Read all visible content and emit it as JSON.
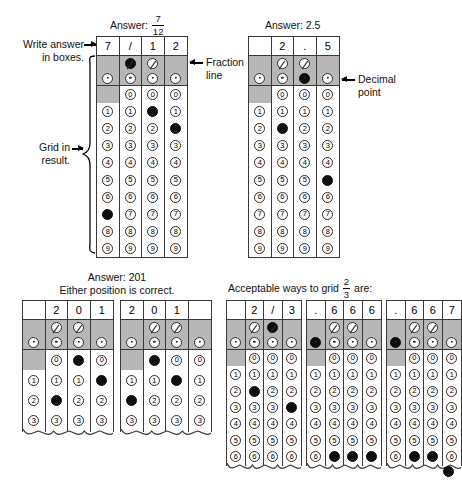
{
  "meta": {
    "width": 461,
    "height": 488,
    "ink": "#000000",
    "shade": "#b7b7b7",
    "fill": "#0d0d0d"
  },
  "labels": {
    "write_answer_line1": "Write answer",
    "write_answer_line2": "in boxes.",
    "grid_in_line1": "Grid in",
    "grid_in_line2": "result.",
    "fraction_line1": "Fraction",
    "fraction_line2": "line",
    "decimal_line1": "Decimal",
    "decimal_line2": "point",
    "answer_prefix": "Answer:",
    "answer1_numerator": "7",
    "answer1_denominator": "12",
    "answer2": "Answer: 2.5",
    "answer3_line1": "Answer: 201",
    "answer3_line2": "Either position is correct.",
    "answer4_prefix": "Acceptable ways to grid",
    "answer4_numerator": "2",
    "answer4_denominator": "3",
    "answer4_suffix": "are:"
  },
  "bubble_rows": {
    "fraction_symbol": "/",
    "decimal_symbol": ".",
    "digits": [
      "0",
      "1",
      "2",
      "3",
      "4",
      "5",
      "6",
      "7",
      "8",
      "9"
    ]
  },
  "grids": [
    {
      "id": "grid-fraction-7-12",
      "headers": [
        "7",
        "/",
        "1",
        "2"
      ],
      "rows": 10,
      "columns": [
        {
          "has_fraction_bubble": false,
          "has_decimal_bubble": true,
          "has_zero_bubble": false,
          "fraction_filled": false,
          "decimal_filled": false,
          "filled_digit": "7"
        },
        {
          "has_fraction_bubble": true,
          "has_decimal_bubble": true,
          "has_zero_bubble": true,
          "fraction_filled": true,
          "decimal_filled": false,
          "filled_digit": null
        },
        {
          "has_fraction_bubble": true,
          "has_decimal_bubble": true,
          "has_zero_bubble": true,
          "fraction_filled": false,
          "decimal_filled": false,
          "filled_digit": "1"
        },
        {
          "has_fraction_bubble": false,
          "has_decimal_bubble": true,
          "has_zero_bubble": true,
          "fraction_filled": false,
          "decimal_filled": false,
          "filled_digit": "2"
        }
      ]
    },
    {
      "id": "grid-decimal-2-5",
      "headers": [
        "",
        "2",
        ".",
        "5"
      ],
      "rows": 10,
      "columns": [
        {
          "has_fraction_bubble": false,
          "has_decimal_bubble": true,
          "has_zero_bubble": false,
          "fraction_filled": false,
          "decimal_filled": false,
          "filled_digit": null
        },
        {
          "has_fraction_bubble": true,
          "has_decimal_bubble": true,
          "has_zero_bubble": true,
          "fraction_filled": false,
          "decimal_filled": false,
          "filled_digit": "2"
        },
        {
          "has_fraction_bubble": true,
          "has_decimal_bubble": true,
          "has_zero_bubble": true,
          "fraction_filled": false,
          "decimal_filled": true,
          "filled_digit": null
        },
        {
          "has_fraction_bubble": false,
          "has_decimal_bubble": true,
          "has_zero_bubble": true,
          "fraction_filled": false,
          "decimal_filled": false,
          "filled_digit": "5"
        }
      ]
    },
    {
      "id": "grid-201-right",
      "headers": [
        "",
        "2",
        "0",
        "1"
      ],
      "rows": 4,
      "columns": [
        {
          "has_fraction_bubble": false,
          "has_decimal_bubble": true,
          "has_zero_bubble": false,
          "fraction_filled": false,
          "decimal_filled": false,
          "filled_digit": null
        },
        {
          "has_fraction_bubble": true,
          "has_decimal_bubble": true,
          "has_zero_bubble": true,
          "fraction_filled": false,
          "decimal_filled": false,
          "filled_digit": "2"
        },
        {
          "has_fraction_bubble": true,
          "has_decimal_bubble": true,
          "has_zero_bubble": true,
          "fraction_filled": false,
          "decimal_filled": false,
          "filled_digit": "0"
        },
        {
          "has_fraction_bubble": false,
          "has_decimal_bubble": true,
          "has_zero_bubble": true,
          "fraction_filled": false,
          "decimal_filled": false,
          "filled_digit": "1"
        }
      ]
    },
    {
      "id": "grid-201-left",
      "headers": [
        "2",
        "0",
        "1",
        ""
      ],
      "rows": 4,
      "columns": [
        {
          "has_fraction_bubble": false,
          "has_decimal_bubble": true,
          "has_zero_bubble": false,
          "fraction_filled": false,
          "decimal_filled": false,
          "filled_digit": "2"
        },
        {
          "has_fraction_bubble": true,
          "has_decimal_bubble": true,
          "has_zero_bubble": true,
          "fraction_filled": false,
          "decimal_filled": false,
          "filled_digit": "0"
        },
        {
          "has_fraction_bubble": true,
          "has_decimal_bubble": true,
          "has_zero_bubble": true,
          "fraction_filled": false,
          "decimal_filled": false,
          "filled_digit": "1"
        },
        {
          "has_fraction_bubble": false,
          "has_decimal_bubble": true,
          "has_zero_bubble": true,
          "fraction_filled": false,
          "decimal_filled": false,
          "filled_digit": null
        }
      ]
    },
    {
      "id": "grid-2-over-3",
      "headers": [
        "",
        "2",
        "/",
        "3"
      ],
      "rows": 7,
      "columns": [
        {
          "has_fraction_bubble": false,
          "has_decimal_bubble": true,
          "has_zero_bubble": false,
          "fraction_filled": false,
          "decimal_filled": false,
          "filled_digit": null
        },
        {
          "has_fraction_bubble": true,
          "has_decimal_bubble": true,
          "has_zero_bubble": true,
          "fraction_filled": false,
          "decimal_filled": false,
          "filled_digit": "2"
        },
        {
          "has_fraction_bubble": true,
          "has_decimal_bubble": true,
          "has_zero_bubble": true,
          "fraction_filled": true,
          "decimal_filled": false,
          "filled_digit": null
        },
        {
          "has_fraction_bubble": false,
          "has_decimal_bubble": true,
          "has_zero_bubble": true,
          "fraction_filled": false,
          "decimal_filled": false,
          "filled_digit": "3"
        }
      ]
    },
    {
      "id": "grid-point-666",
      "headers": [
        ".",
        "6",
        "6",
        "6"
      ],
      "rows": 7,
      "columns": [
        {
          "has_fraction_bubble": false,
          "has_decimal_bubble": true,
          "has_zero_bubble": false,
          "fraction_filled": false,
          "decimal_filled": true,
          "filled_digit": null
        },
        {
          "has_fraction_bubble": true,
          "has_decimal_bubble": true,
          "has_zero_bubble": true,
          "fraction_filled": false,
          "decimal_filled": false,
          "filled_digit": "6"
        },
        {
          "has_fraction_bubble": true,
          "has_decimal_bubble": true,
          "has_zero_bubble": true,
          "fraction_filled": false,
          "decimal_filled": false,
          "filled_digit": "6"
        },
        {
          "has_fraction_bubble": false,
          "has_decimal_bubble": true,
          "has_zero_bubble": true,
          "fraction_filled": false,
          "decimal_filled": false,
          "filled_digit": "6"
        }
      ]
    },
    {
      "id": "grid-point-667",
      "headers": [
        ".",
        "6",
        "6",
        "7"
      ],
      "rows": 7,
      "columns": [
        {
          "has_fraction_bubble": false,
          "has_decimal_bubble": true,
          "has_zero_bubble": false,
          "fraction_filled": false,
          "decimal_filled": true,
          "filled_digit": null
        },
        {
          "has_fraction_bubble": true,
          "has_decimal_bubble": true,
          "has_zero_bubble": true,
          "fraction_filled": false,
          "decimal_filled": false,
          "filled_digit": "6"
        },
        {
          "has_fraction_bubble": true,
          "has_decimal_bubble": true,
          "has_zero_bubble": true,
          "fraction_filled": false,
          "decimal_filled": false,
          "filled_digit": "6"
        },
        {
          "has_fraction_bubble": false,
          "has_decimal_bubble": true,
          "has_zero_bubble": true,
          "fraction_filled": false,
          "decimal_filled": false,
          "filled_digit": "7"
        }
      ]
    }
  ]
}
